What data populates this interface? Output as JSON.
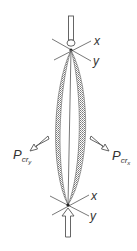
{
  "diagram": {
    "type": "buckled-column",
    "colors": {
      "line": "#555555",
      "hatch": "#888888",
      "background": "#ffffff"
    },
    "top_joint": {
      "axis_labels": {
        "x": "x",
        "y": "y"
      }
    },
    "bottom_joint": {
      "axis_labels": {
        "x": "x",
        "y": "y"
      }
    },
    "loads": {
      "left": {
        "symbol": "P",
        "sub": "cr",
        "subsub": "y"
      },
      "right": {
        "symbol": "P",
        "sub": "cr",
        "subsub": "x"
      }
    }
  }
}
